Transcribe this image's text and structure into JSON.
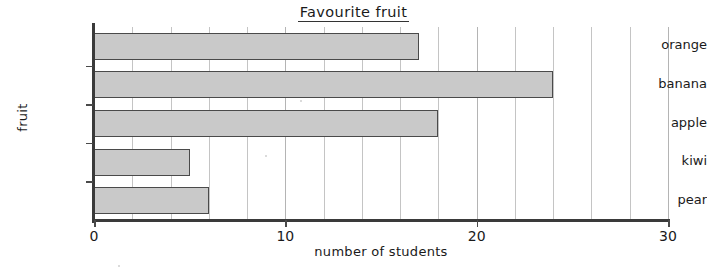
{
  "chart_data": {
    "type": "bar",
    "orientation": "horizontal",
    "title": "Favourite fruit",
    "xlabel": "number of students",
    "ylabel": "fruit",
    "categories": [
      "orange",
      "banana",
      "apple",
      "kiwi",
      "pear"
    ],
    "values": [
      17,
      24,
      18,
      5,
      6
    ],
    "xlim": [
      0,
      30
    ],
    "xticks": [
      0,
      10,
      20,
      30
    ],
    "xtick_labels": [
      "0",
      "10",
      "20",
      "30"
    ],
    "gridline_step": 2,
    "grid": "vertical-only",
    "legend": "none",
    "bar_fill_color": "#c9c9c9",
    "bar_edge_color": "#4a4a4a",
    "axis_color": "#3a3a3a",
    "grid_color": "#c4c4c4",
    "background_color": "#ffffff"
  }
}
